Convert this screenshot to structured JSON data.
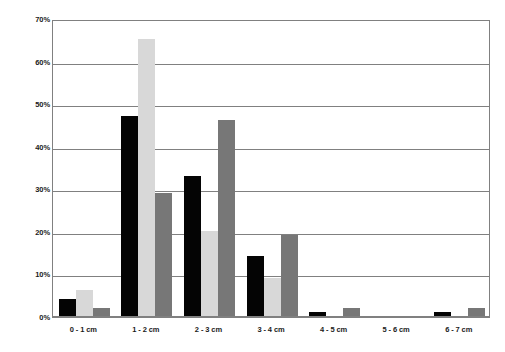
{
  "chart_data": {
    "type": "bar",
    "title": "",
    "subtitle": "",
    "xlabel": "",
    "ylabel": "",
    "ylim": [
      0,
      70
    ],
    "y_tick_labels": [
      "70%",
      "60%",
      "50%",
      "40%",
      "30%",
      "20%",
      "10%",
      "0%"
    ],
    "y_tick_values": [
      70,
      60,
      50,
      40,
      30,
      20,
      10,
      0
    ],
    "grid": true,
    "legend_position": "none",
    "categories": [
      "0 - 1 cm",
      "1 - 2 cm",
      "2 - 3 cm",
      "3 - 4 cm",
      "4 - 5 cm",
      "5 - 6 cm",
      "6 - 7 cm"
    ],
    "series": [
      {
        "name": "series-1",
        "color": "#040404",
        "values": [
          4,
          47,
          33,
          14,
          1,
          0,
          1
        ]
      },
      {
        "name": "series-2",
        "color": "#d8d8d8",
        "values": [
          6,
          65,
          20,
          9,
          0,
          0,
          0
        ]
      },
      {
        "name": "series-3",
        "color": "#777777",
        "values": [
          2,
          29,
          46,
          19,
          2,
          0,
          2
        ]
      }
    ]
  },
  "colors": {
    "axis": "#808080",
    "grid": "#808080",
    "text": "#1a1a1a",
    "background": "#ffffff",
    "series_1": "#040404",
    "series_2": "#d8d8d8",
    "series_3": "#777777"
  }
}
